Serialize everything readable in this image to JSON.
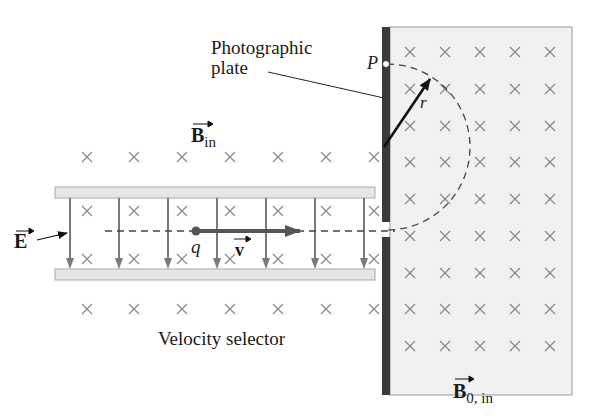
{
  "labels": {
    "photographic_plate_line1": "Photographic",
    "photographic_plate_line2": "plate",
    "point_p": "P",
    "radius": "r",
    "b_in": "B",
    "b_in_sub": "in",
    "e_field": "E",
    "charge": "q",
    "velocity": "v",
    "velocity_selector": "Velocity selector",
    "b0_in": "B",
    "b0_in_sub": "0, in"
  },
  "colors": {
    "plate": "#3a3a3a",
    "field_region": "#f1f1f1",
    "field_border": "#9a9a9a",
    "cross": "#8a8a8a",
    "e_arrows": "#7a7a7a",
    "capacitor_plate": "#e6e6e6",
    "velocity_arrow": "#555555",
    "text": "#1a1a1a"
  },
  "geometry": {
    "left_cross_cols_x": [
      87,
      134,
      182,
      230,
      278,
      326,
      374
    ],
    "left_cross_rows_y": [
      157,
      211,
      259,
      309
    ],
    "right_cross_cols_x": [
      410,
      445,
      480,
      515,
      550
    ],
    "right_cross_rows_y": [
      52,
      89,
      126,
      162,
      199,
      236,
      273,
      309,
      346
    ],
    "e_arrow_x": [
      70,
      119,
      168,
      217,
      266,
      315,
      364
    ]
  }
}
